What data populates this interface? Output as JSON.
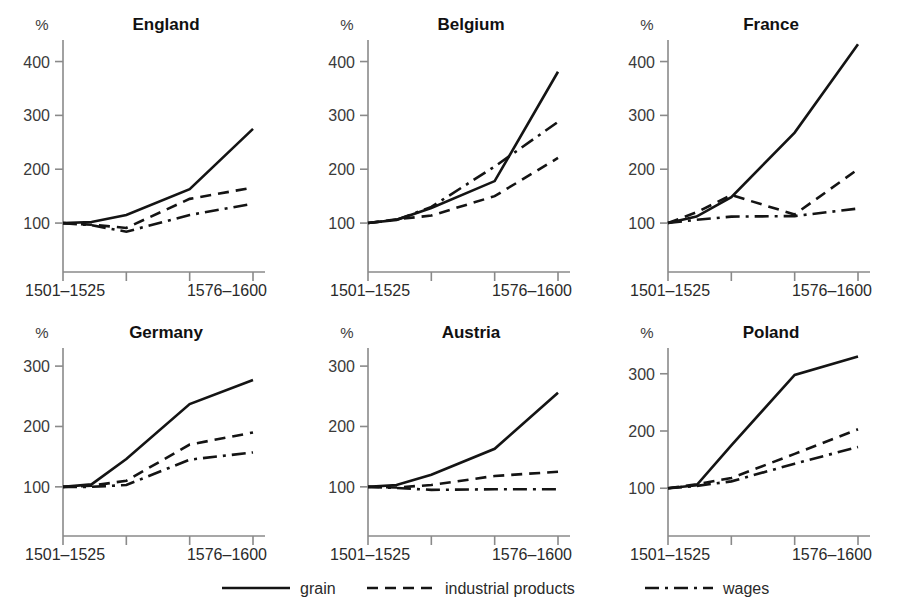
{
  "figure": {
    "axis_unit_label": "%",
    "x_axis_labels": {
      "start": "1501–1525",
      "end": "1576–1600"
    },
    "line_color": "#141414",
    "axis_color": "#8a8a8a",
    "background": "#ffffff"
  },
  "legend": {
    "position": "bottom-center",
    "entries": [
      {
        "label": "grain",
        "style": "solid",
        "dasharray": ""
      },
      {
        "label": "industrial products",
        "style": "dashed",
        "dasharray": "11,7"
      },
      {
        "label": "wages",
        "style": "dash-dot",
        "dasharray": "14,6,3,6"
      }
    ]
  },
  "chart_data": [
    {
      "type": "line",
      "title": "England",
      "xlabel": "",
      "ylabel": "%",
      "x": [
        "1501–1525",
        "1526–1550",
        "1551–1575",
        "1576–1600"
      ],
      "xlim": [
        0,
        3
      ],
      "ylim": [
        50,
        440
      ],
      "yticks": [
        100,
        200,
        300,
        400
      ],
      "ytick_labels": [
        "100",
        "200",
        "300",
        "400"
      ],
      "grid": false,
      "series": [
        {
          "name": "grain",
          "style": "solid",
          "values": [
            100,
            102,
            115,
            163,
            275
          ]
        },
        {
          "name": "industrial products",
          "style": "dashed",
          "values": [
            100,
            97,
            91,
            145,
            166
          ]
        },
        {
          "name": "wages",
          "style": "dash-dot",
          "values": [
            100,
            96,
            84,
            115,
            136
          ]
        }
      ],
      "series_x": [
        0,
        0.45,
        1,
        2,
        3
      ]
    },
    {
      "type": "line",
      "title": "Belgium",
      "xlabel": "",
      "ylabel": "%",
      "x": [
        "1501–1525",
        "1526–1550",
        "1551–1575",
        "1576–1600"
      ],
      "xlim": [
        0,
        3
      ],
      "ylim": [
        50,
        440
      ],
      "yticks": [
        100,
        200,
        300,
        400
      ],
      "ytick_labels": [
        "100",
        "200",
        "300",
        "400"
      ],
      "grid": false,
      "series": [
        {
          "name": "grain",
          "style": "solid",
          "values": [
            100,
            106,
            128,
            178,
            381
          ]
        },
        {
          "name": "industrial products",
          "style": "dashed",
          "values": [
            100,
            107,
            114,
            150,
            221
          ]
        },
        {
          "name": "wages",
          "style": "dash-dot",
          "values": [
            100,
            106,
            130,
            205,
            288
          ]
        }
      ],
      "series_x": [
        0,
        0.45,
        1,
        2,
        3
      ]
    },
    {
      "type": "line",
      "title": "France",
      "xlabel": "",
      "ylabel": "%",
      "x": [
        "1501–1525",
        "1526–1550",
        "1551–1575",
        "1576–1600"
      ],
      "xlim": [
        0,
        3
      ],
      "ylim": [
        50,
        440
      ],
      "yticks": [
        100,
        200,
        300,
        400
      ],
      "ytick_labels": [
        "100",
        "200",
        "300",
        "400"
      ],
      "grid": false,
      "series": [
        {
          "name": "grain",
          "style": "solid",
          "values": [
            100,
            112,
            148,
            268,
            432
          ]
        },
        {
          "name": "industrial products",
          "style": "dashed",
          "values": [
            100,
            120,
            152,
            116,
            200
          ]
        },
        {
          "name": "wages",
          "style": "dash-dot",
          "values": [
            100,
            106,
            112,
            113,
            127
          ]
        }
      ],
      "series_x": [
        0,
        0.45,
        1,
        2,
        3
      ]
    },
    {
      "type": "line",
      "title": "Germany",
      "xlabel": "",
      "ylabel": "%",
      "x": [
        "1501–1525",
        "1526–1550",
        "1551–1575",
        "1576–1600"
      ],
      "xlim": [
        0,
        3
      ],
      "ylim": [
        55,
        330
      ],
      "yticks": [
        100,
        200,
        300
      ],
      "ytick_labels": [
        "100",
        "200",
        "300"
      ],
      "grid": false,
      "series": [
        {
          "name": "grain",
          "style": "solid",
          "values": [
            100,
            104,
            146,
            237,
            277
          ]
        },
        {
          "name": "industrial products",
          "style": "dashed",
          "values": [
            100,
            102,
            110,
            170,
            190
          ]
        },
        {
          "name": "wages",
          "style": "dash-dot",
          "values": [
            100,
            100,
            103,
            145,
            157
          ]
        }
      ],
      "series_x": [
        0,
        0.45,
        1,
        2,
        3
      ]
    },
    {
      "type": "line",
      "title": "Austria",
      "xlabel": "",
      "ylabel": "%",
      "x": [
        "1501–1525",
        "1526–1550",
        "1551–1575",
        "1576–1600"
      ],
      "xlim": [
        0,
        3
      ],
      "ylim": [
        55,
        330
      ],
      "yticks": [
        100,
        200,
        300
      ],
      "ytick_labels": [
        "100",
        "200",
        "300"
      ],
      "grid": false,
      "series": [
        {
          "name": "grain",
          "style": "solid",
          "values": [
            100,
            103,
            120,
            163,
            256
          ]
        },
        {
          "name": "industrial products",
          "style": "dashed",
          "values": [
            100,
            99,
            103,
            118,
            125
          ]
        },
        {
          "name": "wages",
          "style": "dash-dot",
          "values": [
            100,
            98,
            95,
            96,
            96
          ]
        }
      ],
      "series_x": [
        0,
        0.45,
        1,
        2,
        3
      ]
    },
    {
      "type": "line",
      "title": "Poland",
      "xlabel": "",
      "ylabel": "%",
      "x": [
        "1501–1525",
        "1526–1550",
        "1551–1575",
        "1576–1600"
      ],
      "xlim": [
        0,
        3
      ],
      "ylim": [
        55,
        345
      ],
      "yticks": [
        100,
        200,
        300
      ],
      "ytick_labels": [
        "100",
        "200",
        "300"
      ],
      "grid": false,
      "series": [
        {
          "name": "grain",
          "style": "solid",
          "values": [
            100,
            105,
            175,
            298,
            330
          ]
        },
        {
          "name": "industrial products",
          "style": "dashed",
          "values": [
            100,
            107,
            118,
            160,
            203
          ]
        },
        {
          "name": "wages",
          "style": "dash-dot",
          "values": [
            100,
            104,
            112,
            143,
            172
          ]
        }
      ],
      "series_x": [
        0,
        0.45,
        1,
        2,
        3
      ]
    }
  ]
}
